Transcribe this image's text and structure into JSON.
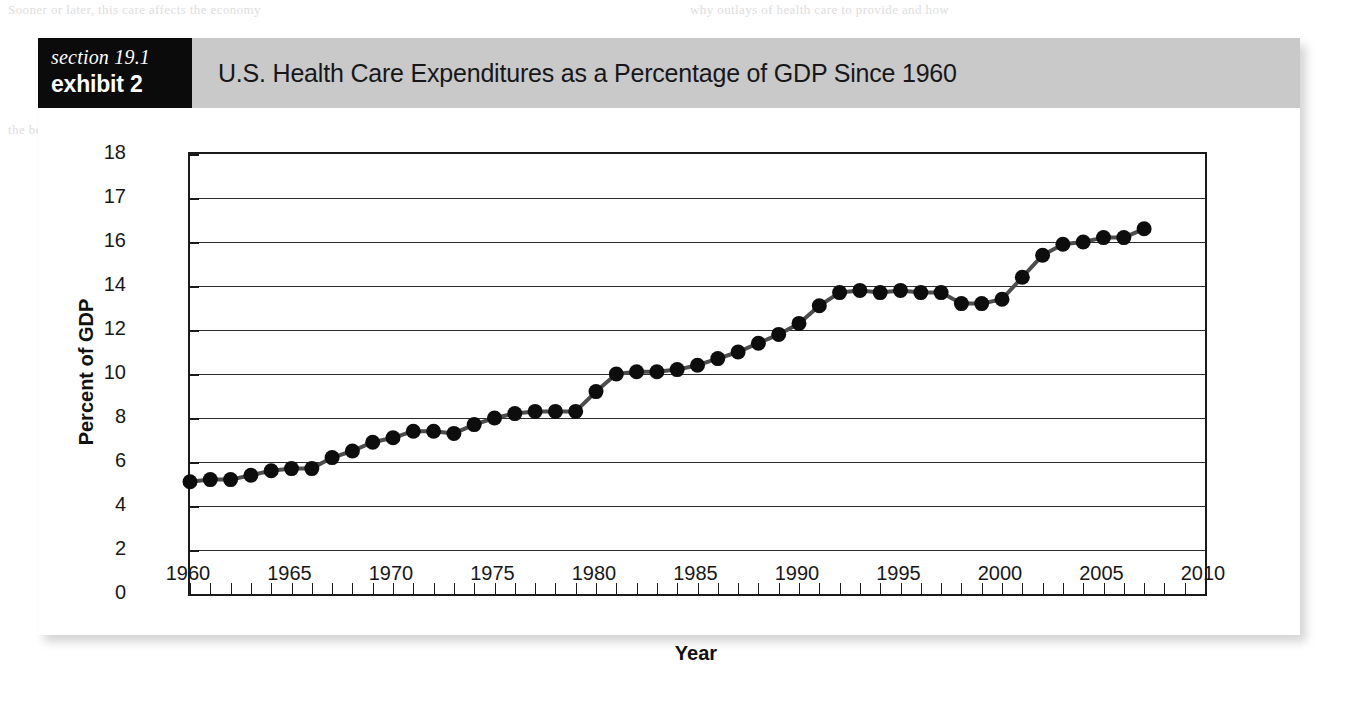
{
  "figure": {
    "section_label": "section 19.1",
    "exhibit_label": "exhibit 2",
    "title": "U.S. Health Care Expenditures as a Percentage of GDP Since 1960"
  },
  "page_bleed": {
    "lines": [
      "Sooner or later, this care affects the economy",
      "why outlays of health care to provide and how",
      "the best resources to use; what marginal cost",
      "health care markets should also be considered as a",
      "resource to the discipline of economics",
      "that can and how they are"
    ]
  },
  "colors": {
    "header_band": "#c9c9c9",
    "label_block": "#0b0b0b",
    "axis": "#1a1a1a",
    "gridline": "#2a2a2a",
    "series_line": "#4d4d4d",
    "marker": "#0d0d0d",
    "page_background": "#ffffff"
  },
  "chart_data": {
    "type": "line",
    "title": "U.S. Health Care Expenditures as a Percentage of GDP Since 1960",
    "xlabel": "Year",
    "ylabel": "Percent of GDP",
    "xlim": [
      1960,
      2010
    ],
    "ylim": [
      0,
      18
    ],
    "grid": true,
    "legend": null,
    "x_tick_labels": [
      "1960",
      "1965",
      "1970",
      "1975",
      "1980",
      "1985",
      "1990",
      "1995",
      "2000",
      "2005",
      "2010"
    ],
    "x_tick_values": [
      1960,
      1965,
      1970,
      1975,
      1980,
      1985,
      1990,
      1995,
      2000,
      2005,
      2010
    ],
    "x_minor_tick_step": 1,
    "y_tick_labels": [
      "0",
      "2",
      "4",
      "6",
      "8",
      "10",
      "12",
      "14",
      "16",
      "17",
      "18"
    ],
    "y_tick_values": [
      0,
      2,
      4,
      6,
      8,
      10,
      12,
      14,
      16,
      17,
      18
    ],
    "y_axis_note": "Tick labels are evenly spaced on the axis even though the top interval changes from 2 to 1 unit.",
    "series": [
      {
        "name": "U.S. health care expenditures as a percentage of GDP",
        "x": [
          1960,
          1961,
          1962,
          1963,
          1964,
          1965,
          1966,
          1967,
          1968,
          1969,
          1970,
          1971,
          1972,
          1973,
          1974,
          1975,
          1976,
          1977,
          1978,
          1979,
          1980,
          1981,
          1982,
          1983,
          1984,
          1985,
          1986,
          1987,
          1988,
          1989,
          1990,
          1991,
          1992,
          1993,
          1994,
          1995,
          1996,
          1997,
          1998,
          1999,
          2000,
          2001,
          2002,
          2003,
          2004,
          2005,
          2006,
          2007
        ],
        "values": [
          5.1,
          5.2,
          5.2,
          5.4,
          5.6,
          5.7,
          5.7,
          6.2,
          6.5,
          6.9,
          7.1,
          7.4,
          7.4,
          7.3,
          7.7,
          8.0,
          8.2,
          8.3,
          8.3,
          8.3,
          9.2,
          10.0,
          10.1,
          10.1,
          10.2,
          10.4,
          10.7,
          11.0,
          11.4,
          11.8,
          12.3,
          13.1,
          13.7,
          13.8,
          13.7,
          13.8,
          13.7,
          13.7,
          13.2,
          13.2,
          13.4,
          14.4,
          15.4,
          15.9,
          16.0,
          16.1,
          16.1,
          16.3
        ]
      }
    ]
  }
}
